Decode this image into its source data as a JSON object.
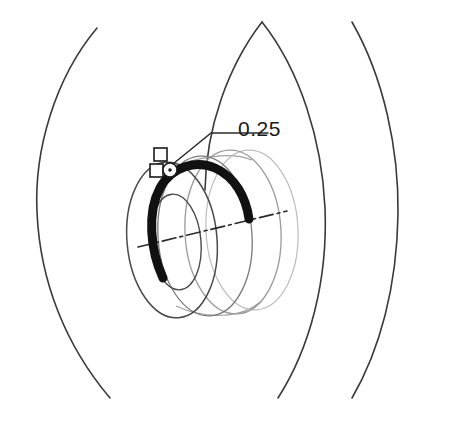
{
  "figure": {
    "background_color": "#ffffff",
    "width": 467,
    "height": 421
  },
  "callout": {
    "label": "0.25",
    "label_x": 238,
    "label_y": 136,
    "leader_color": "#2b2b2b",
    "leader_polyline": "168,168 184,155 211,133 268,133",
    "marker_names": [
      "square-marker-upper",
      "square-marker-lower",
      "circle-marker-point"
    ]
  },
  "markers": {
    "square_upper": {
      "x": 154,
      "y": 148,
      "size": 13,
      "stroke": "#1a1a1a"
    },
    "square_lower": {
      "x": 150,
      "y": 164,
      "size": 13,
      "stroke": "#1a1a1a"
    },
    "circle_point": {
      "cx": 170,
      "cy": 170,
      "r": 7,
      "stroke": "#1a1a1a",
      "dot_r": 1.8
    }
  },
  "colors": {
    "contour_line": "#3a3a3a",
    "coil_dark": "#111111",
    "ring_mid": "#4a4a4a",
    "ring_light": "#9a9a9a",
    "ring_faint": "#bdbdbd",
    "centerline": "#2b2b2b",
    "text": "#1a1a1a"
  },
  "contours": {
    "description": "Four large concentric arc contours spanning the frame",
    "items": [
      {
        "name": "contour-arc-outer-left",
        "path": "M 97,28 C 55,78 34,150 37,212 C 40,282 66,346 110,398",
        "stroke": "#3a3a3a",
        "width": 1.6
      },
      {
        "name": "contour-arc-inner-left",
        "path": "M 262,22 C 228,66 206,128 205,190",
        "stroke": "#3a3a3a",
        "width": 1.6
      },
      {
        "name": "contour-arc-mid-right",
        "path": "M 262,22 C 300,70 322,140 325,208 C 328,280 310,348 278,398",
        "stroke": "#3a3a3a",
        "width": 1.6
      },
      {
        "name": "contour-arc-outer-right",
        "path": "M 352,22 C 384,78 399,150 398,214 C 397,286 380,350 352,398",
        "stroke": "#3a3a3a",
        "width": 1.6
      }
    ]
  },
  "coil": {
    "description": "Thick dark crescent representing the wound coil conductor",
    "path": "M 163,278 C 150,250 147,212 160,188 C 172,166 197,160 215,168 C 235,177 246,197 249,219",
    "stroke": "#111111",
    "width": 9
  },
  "rings": {
    "description": "Concentric elliptical rings forming the 3D toroidal body in perspective",
    "items": [
      {
        "name": "ring-ellipse-outer-front",
        "cx": 172,
        "cy": 240,
        "rx": 45,
        "ry": 78,
        "rot": -5,
        "stroke": "#4a4a4a",
        "width": 1.5
      },
      {
        "name": "ring-ellipse-inner-front",
        "cx": 176,
        "cy": 242,
        "rx": 25,
        "ry": 48,
        "rot": -5,
        "stroke": "#4a4a4a",
        "width": 1.4
      },
      {
        "name": "ring-ellipse-mid-body",
        "cx": 205,
        "cy": 236,
        "rx": 47,
        "ry": 80,
        "rot": -4,
        "stroke": "#7a7a7a",
        "width": 1.3
      },
      {
        "name": "ring-ellipse-outer-back",
        "cx": 233,
        "cy": 232,
        "rx": 48,
        "ry": 82,
        "rot": -3,
        "stroke": "#9a9a9a",
        "width": 1.3
      },
      {
        "name": "ring-ellipse-far-back",
        "cx": 252,
        "cy": 230,
        "rx": 46,
        "ry": 80,
        "rot": -3,
        "stroke": "#bdbdbd",
        "width": 1.2
      }
    ],
    "connectors": [
      {
        "name": "ring-connector-top",
        "path": "M 163,172 C 196,155 232,152 252,160",
        "stroke": "#a0a0a0",
        "width": 1.2
      },
      {
        "name": "ring-connector-bottom",
        "path": "M 176,306 C 206,320 242,318 260,302",
        "stroke": "#a0a0a0",
        "width": 1.2
      }
    ]
  },
  "centerline": {
    "name": "axis-centerline",
    "path": "M 138,247 L 287,211",
    "stroke": "#2b2b2b",
    "width": 1.6,
    "dash": "14,4,3,4"
  }
}
